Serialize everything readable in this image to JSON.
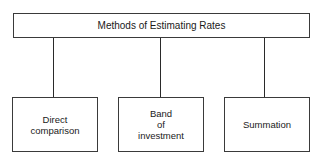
{
  "diagram": {
    "root": {
      "label": "Methods of Estimating Rates"
    },
    "children": [
      {
        "label": "Direct\ncomparison"
      },
      {
        "label": "Band\nof\ninvestment"
      },
      {
        "label": "Summation"
      }
    ],
    "colors": {
      "line": "#2a2a2a",
      "box_border": "#3a3a3a",
      "background": "#ffffff",
      "text": "#1a1a1a"
    }
  }
}
